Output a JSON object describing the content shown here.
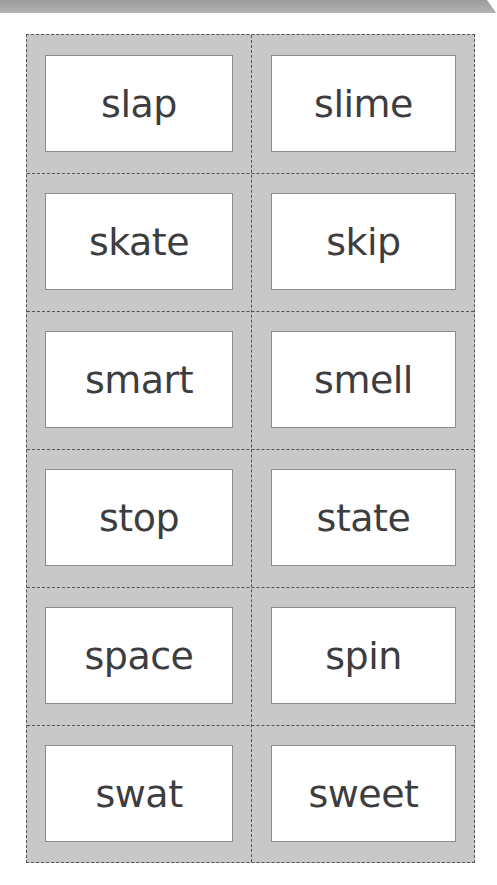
{
  "header": {
    "bar_color": "#a6a6a6"
  },
  "sheet": {
    "background": "#c8c8c8",
    "cut_line_color": "#555555",
    "card_border_color": "#8c8c8c",
    "text_color": "#3d3d3f"
  },
  "cards": [
    {
      "row": 1,
      "left": "slap",
      "right": "slime"
    },
    {
      "row": 2,
      "left": "skate",
      "right": "skip"
    },
    {
      "row": 3,
      "left": "smart",
      "right": "smell"
    },
    {
      "row": 4,
      "left": "stop",
      "right": "state"
    },
    {
      "row": 5,
      "left": "space",
      "right": "spin"
    },
    {
      "row": 6,
      "left": "swat",
      "right": "sweet"
    }
  ]
}
